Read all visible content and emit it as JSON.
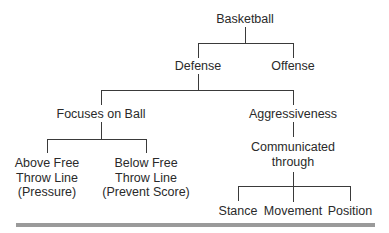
{
  "diagram": {
    "type": "tree",
    "root": "Basketball",
    "nodes": {
      "basketball": {
        "label": "Basketball"
      },
      "defense": {
        "label": "Defense"
      },
      "offense": {
        "label": "Offense"
      },
      "focuses_on_ball": {
        "label": "Focuses on Ball"
      },
      "aggressiveness": {
        "label": "Aggressiveness"
      },
      "above_free_throw": {
        "lines": [
          "Above Free",
          "Throw Line",
          "(Pressure)"
        ]
      },
      "below_free_throw": {
        "lines": [
          "Below Free",
          "Throw Line",
          "(Prevent Score)"
        ]
      },
      "communicated_through": {
        "lines": [
          "Communicated",
          "through"
        ]
      },
      "stance": {
        "label": "Stance"
      },
      "movement": {
        "label": "Movement"
      },
      "position": {
        "label": "Position"
      }
    },
    "edges": [
      [
        "Basketball",
        "Defense"
      ],
      [
        "Basketball",
        "Offense"
      ],
      [
        "Defense",
        "Focuses on Ball"
      ],
      [
        "Defense",
        "Aggressiveness"
      ],
      [
        "Focuses on Ball",
        "Above Free Throw Line (Pressure)"
      ],
      [
        "Focuses on Ball",
        "Below Free Throw Line (Prevent Score)"
      ],
      [
        "Aggressiveness",
        "Communicated through"
      ],
      [
        "Communicated through",
        "Stance"
      ],
      [
        "Communicated through",
        "Movement"
      ],
      [
        "Communicated through",
        "Position"
      ]
    ],
    "colors": {
      "text": "#2a2a2a",
      "lines": "#3a3a3a",
      "bottom_rule": "#9a9a9a"
    }
  }
}
